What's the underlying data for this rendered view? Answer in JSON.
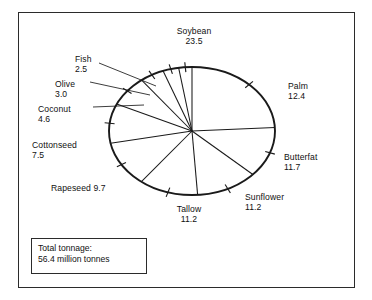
{
  "figure": {
    "border_color": "#2b2b2b",
    "line_color": "#1a1a1a",
    "background": "#ffffff"
  },
  "total_box": {
    "line1": "Total tonnage:",
    "line2": "56.4 million tonnes"
  },
  "chart_data": {
    "type": "pie",
    "title": "",
    "subtitle": "",
    "xlabel": "",
    "ylabel": "",
    "legend_position": "none",
    "grid": false,
    "unit": "million tonnes",
    "total": 56.4,
    "total_label": "Total tonnage: 56.4 million tonnes",
    "start_angle_deg": 0,
    "direction": "clockwise",
    "categories": [
      "Soybean",
      "Palm",
      "Butterfat",
      "Sunflower",
      "Tallow",
      "Rapeseed",
      "Cottonseed",
      "Coconut",
      "Olive",
      "Fish"
    ],
    "values": [
      23.5,
      12.4,
      11.7,
      11.2,
      11.2,
      9.7,
      7.5,
      4.6,
      3.0,
      2.5
    ],
    "slices": [
      {
        "label": "Soybean",
        "value": "23.5",
        "value_num": 23.5
      },
      {
        "label": "Palm",
        "value": "12.4",
        "value_num": 12.4
      },
      {
        "label": "Butterfat",
        "value": "11.7",
        "value_num": 11.7
      },
      {
        "label": "Sunflower",
        "value": "11.2",
        "value_num": 11.2
      },
      {
        "label": "Tallow",
        "value": "11.2",
        "value_num": 11.2
      },
      {
        "label": "Rapeseed",
        "value": "9.7",
        "value_num": 9.7
      },
      {
        "label": "Cottonseed",
        "value": "7.5",
        "value_num": 7.5
      },
      {
        "label": "Coconut",
        "value": "4.6",
        "value_num": 4.6
      },
      {
        "label": "Olive",
        "value": "3.0",
        "value_num": 3.0
      },
      {
        "label": "Fish",
        "value": "2.5",
        "value_num": 2.5
      }
    ]
  },
  "labels": {
    "soybean": {
      "name": "Soybean",
      "value": "23.5"
    },
    "palm": {
      "name": "Palm",
      "value": "12.4"
    },
    "butterfat": {
      "name": "Butterfat",
      "value": "11.7"
    },
    "sunflower": {
      "name": "Sunflower",
      "value": "11.2"
    },
    "tallow": {
      "name": "Tallow",
      "value": "11.2"
    },
    "rapeseed": {
      "name": "Rapeseed ",
      "value": "9.7"
    },
    "cottonseed": {
      "name": "Cottonseed",
      "value": "7.5"
    },
    "coconut": {
      "name": "Coconut",
      "value": "4.6"
    },
    "olive": {
      "name": "Olive",
      "value": "3.0"
    },
    "fish": {
      "name": "Fish",
      "value": "2.5"
    }
  }
}
